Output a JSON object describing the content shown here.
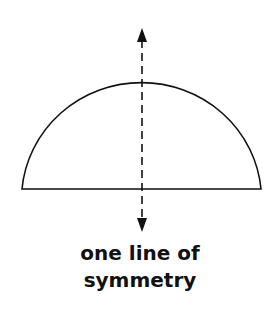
{
  "figure": {
    "shape": "semicircle",
    "caption_line1": "one line of",
    "caption_line2": "symmetry",
    "colors": {
      "stroke": "#111111",
      "background": "#ffffff"
    }
  }
}
